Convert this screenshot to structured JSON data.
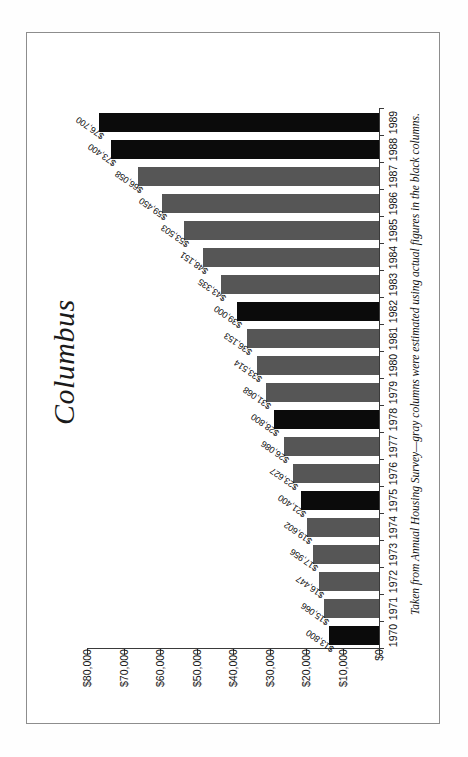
{
  "chart_data": {
    "type": "bar",
    "orientation": "vertical-printed-sideways",
    "title": "Columbus",
    "xlabel": "",
    "ylabel": "",
    "ylim": [
      0,
      80000
    ],
    "grid": false,
    "legend": "none",
    "caption": "Taken from Annual Housing Survey—gray columns were estimated using actual figures in the black columns.",
    "categories": [
      "1970",
      "1971",
      "1972",
      "1973",
      "1974",
      "1975",
      "1976",
      "1977",
      "1978",
      "1979",
      "1980",
      "1981",
      "1982",
      "1983",
      "1984",
      "1985",
      "1986",
      "1987",
      "1988",
      "1989"
    ],
    "values": [
      13800,
      15066,
      16447,
      17956,
      19602,
      21400,
      23627,
      26086,
      28800,
      31068,
      33514,
      36153,
      39000,
      43335,
      48151,
      53503,
      59450,
      66058,
      73400,
      76700
    ],
    "value_labels": [
      "$13,800",
      "$15,066",
      "$16,447",
      "$17,956",
      "$19,602",
      "$21,400",
      "$23,627",
      "$26,086",
      "$28,800",
      "$31,068",
      "$33,514",
      "$36,153",
      "$39,000",
      "$43,335",
      "$48,151",
      "$53,503",
      "$59,450",
      "$66,058",
      "$73,400",
      "$76,700"
    ],
    "series_kind": [
      "actual",
      "estimated",
      "estimated",
      "estimated",
      "estimated",
      "actual",
      "estimated",
      "estimated",
      "actual",
      "estimated",
      "estimated",
      "estimated",
      "actual",
      "estimated",
      "estimated",
      "estimated",
      "estimated",
      "estimated",
      "actual",
      "actual"
    ],
    "bar_colors": [
      "black",
      "gray",
      "gray",
      "gray",
      "gray",
      "black",
      "gray",
      "gray",
      "black",
      "gray",
      "gray",
      "gray",
      "black",
      "gray",
      "gray",
      "gray",
      "gray",
      "gray",
      "black",
      "black"
    ],
    "axis_ticks": [
      "$0",
      "$10,000",
      "$20,000",
      "$30,000",
      "$40,000",
      "$50,000",
      "$60,000",
      "$70,000",
      "$80,000"
    ],
    "axis_tick_values": [
      0,
      10000,
      20000,
      30000,
      40000,
      50000,
      60000,
      70000,
      80000
    ],
    "colors": {
      "black_bar": "#0b0b0b",
      "gray_bar": "#565656",
      "axis": "#3a3a3a",
      "text": "#111111",
      "page": "#ffffff",
      "frame": "#8d8d8d"
    }
  }
}
